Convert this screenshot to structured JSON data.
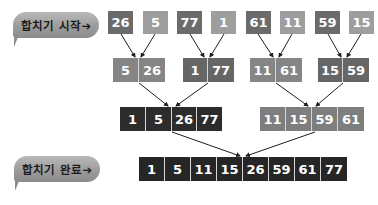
{
  "labels": {
    "merge_start": "합치기 시작➔",
    "merge_done": "합치기 완료➔"
  },
  "colors": {
    "dark_gray": "#6b6b6b",
    "light_gray": "#9e9e9e",
    "mid_gray": "#7e7e7e",
    "near_black": "#262626",
    "pair_gray": "#858585",
    "arrow": "#1e1e1e"
  },
  "level1": {
    "values": [
      "26",
      "5",
      "77",
      "1",
      "61",
      "11",
      "59",
      "15"
    ]
  },
  "level2": {
    "pairs": [
      [
        "5",
        "26"
      ],
      [
        "1",
        "77"
      ],
      [
        "11",
        "61"
      ],
      [
        "15",
        "59"
      ]
    ]
  },
  "level3": {
    "groups": [
      [
        "1",
        "5",
        "26",
        "77"
      ],
      [
        "11",
        "15",
        "59",
        "61"
      ]
    ]
  },
  "level4": {
    "values": [
      "1",
      "5",
      "11",
      "15",
      "26",
      "59",
      "61",
      "77"
    ]
  }
}
